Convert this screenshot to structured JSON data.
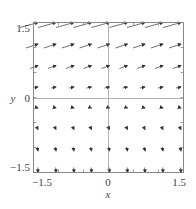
{
  "chart_data": {
    "type": "vector_field",
    "title": "",
    "xlabel": "x",
    "ylabel": "y",
    "xlim": [
      -1.5,
      1.5
    ],
    "ylim": [
      -1.5,
      1.5
    ],
    "grid": false,
    "legend": null,
    "x_ticks": [
      {
        "value": -1.5,
        "label": "−1.5"
      },
      {
        "value": 0,
        "label": "0"
      },
      {
        "value": 1.5,
        "label": "1.5"
      }
    ],
    "y_ticks": [
      {
        "value": 1.5,
        "label": "1.5"
      },
      {
        "value": 0,
        "label": "0"
      },
      {
        "value": -1.5,
        "label": "−1.5"
      }
    ],
    "sample_x": [
      -1.43,
      -1.07,
      -0.71,
      -0.36,
      0.0,
      0.36,
      0.71,
      1.07,
      1.43
    ],
    "rows": [
      {
        "y": 1.5,
        "dx": 18,
        "dy": -5,
        "description": "long arrows, pointing right and slightly up"
      },
      {
        "y": 1.07,
        "dx": 12,
        "dy": -4,
        "description": "medium arrows, right and slightly up"
      },
      {
        "y": 0.64,
        "dx": 8,
        "dy": -3,
        "description": "short arrows, right and slightly up"
      },
      {
        "y": 0.21,
        "dx": 5,
        "dy": -1,
        "description": "small arrows, mostly right"
      },
      {
        "y": -0.21,
        "dx": 3,
        "dy": 1,
        "description": "tiny arrows, right and slightly down"
      },
      {
        "y": -0.64,
        "dx": 1.5,
        "dy": 3,
        "description": "tiny arrows, mostly down"
      },
      {
        "y": -1.07,
        "dx": 0.8,
        "dy": 4,
        "description": "tiny arrows, nearly vertical down"
      },
      {
        "y": -1.5,
        "dx": 0.3,
        "dy": 5,
        "description": "tiny arrows, vertical down"
      }
    ]
  },
  "labels": {
    "x_axis": "x",
    "y_axis": "y",
    "x_tick_min": "−1.5",
    "x_tick_zero": "0",
    "x_tick_max": "1.5",
    "y_tick_max": "1.5",
    "y_tick_zero": "0",
    "y_tick_min": "−1.5"
  },
  "colors": {
    "frame": "#888888",
    "axes": "#999999",
    "arrows": "#333333",
    "text": "#444444"
  }
}
